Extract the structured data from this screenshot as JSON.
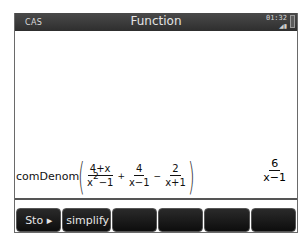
{
  "titlebar": {
    "mode": "CAS",
    "title": "Function",
    "clock": "01:32",
    "signal_icon": "signal-icon",
    "battery_icon": "battery-icon"
  },
  "history": {
    "entries": [
      {
        "command": "comDenom",
        "terms": [
          {
            "numerator": "4+x",
            "denominator_base": "x",
            "denominator_exp": "2",
            "denominator_rest": "−1"
          },
          {
            "operator": "+",
            "numerator": "4",
            "denominator": "x−1"
          },
          {
            "operator": "−",
            "numerator": "2",
            "denominator": "x+1"
          }
        ],
        "result": {
          "numerator": "6",
          "denominator": "x−1"
        }
      }
    ]
  },
  "softkeys": [
    {
      "label": "Sto ▸"
    },
    {
      "label": "simplify"
    },
    {
      "label": ""
    },
    {
      "label": ""
    },
    {
      "label": ""
    },
    {
      "label": ""
    }
  ]
}
